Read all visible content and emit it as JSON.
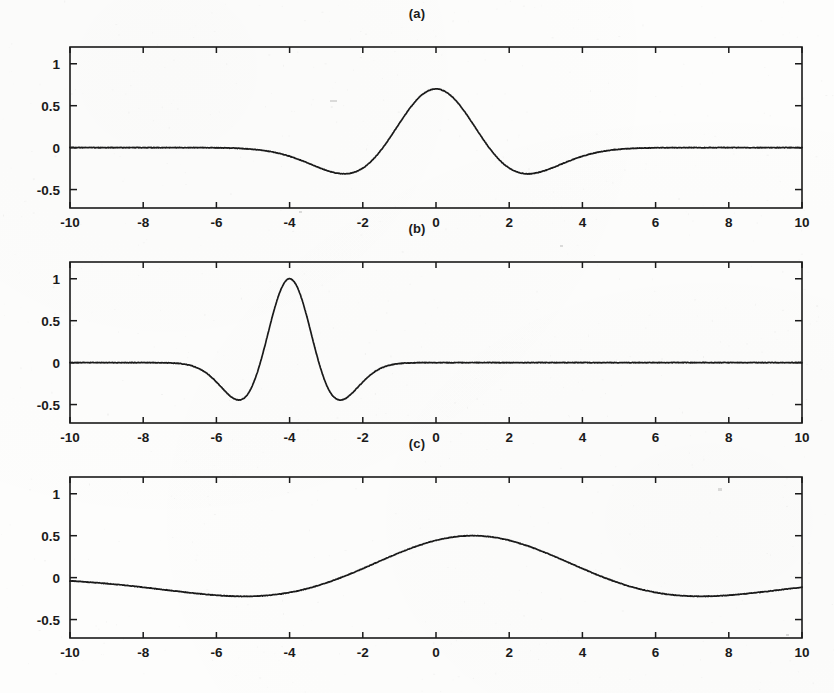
{
  "figure": {
    "background_color": "#fdfdfc",
    "line_color": "#1a1a1a",
    "axis_color": "#1a1a1a",
    "tick_label_color": "#1a1a1a"
  },
  "panels": [
    {
      "title": "(a)",
      "name": "panel-a"
    },
    {
      "title": "(b)",
      "name": "panel-b"
    },
    {
      "title": "(c)",
      "name": "panel-c"
    }
  ],
  "axes": {
    "x_tick_labels": [
      "-10",
      "-8",
      "-6",
      "-4",
      "-2",
      "0",
      "2",
      "4",
      "6",
      "8",
      "10"
    ],
    "x_tick_values": [
      -10,
      -8,
      -6,
      -4,
      -2,
      0,
      2,
      4,
      6,
      8,
      10
    ],
    "y_tick_labels": [
      "1",
      "0.5",
      "0",
      "-0.5"
    ],
    "y_tick_values": [
      1,
      0.5,
      0,
      -0.5
    ],
    "xlim": [
      -10,
      10
    ],
    "ylim": [
      -0.72,
      1.2
    ]
  },
  "chart_data": [
    {
      "type": "line",
      "title": "(a)",
      "xlabel": "",
      "ylabel": "",
      "xlim": [
        -10,
        10
      ],
      "ylim": [
        -0.72,
        1.2
      ],
      "grid": false,
      "legend": null,
      "x_ticks": [
        -10,
        -8,
        -6,
        -4,
        -2,
        0,
        2,
        4,
        6,
        8,
        10
      ],
      "y_ticks": [
        1,
        0.5,
        0,
        -0.5
      ],
      "description": "Mexican hat (Ricker) wavelet, centered at x = 0, scale a = 1.45, peak amplitude 0.70",
      "wavelet": {
        "center": 0,
        "scale": 1.45,
        "amplitude": 0.7
      },
      "peak": {
        "x": 0,
        "y": 0.7
      },
      "troughs": [
        {
          "x": -2.5,
          "y": -0.32
        },
        {
          "x": 2.5,
          "y": -0.32
        }
      ],
      "zero_crossings": [
        -1.45,
        1.45
      ],
      "x": [
        -10,
        -9,
        -8,
        -7,
        -6,
        -5.5,
        -5,
        -4.5,
        -4,
        -3.5,
        -3,
        -2.5,
        -2,
        -1.5,
        -1,
        -0.5,
        0,
        0.5,
        1,
        1.5,
        2,
        2.5,
        3,
        3.5,
        4,
        4.5,
        5,
        5.5,
        6,
        7,
        8,
        9,
        10
      ],
      "y": [
        0,
        0,
        -0.001,
        -0.008,
        -0.045,
        -0.093,
        -0.163,
        -0.244,
        -0.305,
        -0.331,
        -0.312,
        -0.246,
        -0.106,
        0.103,
        0.332,
        0.553,
        0.7,
        0.553,
        0.332,
        0.103,
        -0.106,
        -0.246,
        -0.312,
        -0.331,
        -0.305,
        -0.244,
        -0.163,
        -0.093,
        -0.045,
        -0.008,
        -0.001,
        0,
        0
      ]
    },
    {
      "type": "line",
      "title": "(b)",
      "xlabel": "",
      "ylabel": "",
      "xlim": [
        -10,
        10
      ],
      "ylim": [
        -0.72,
        1.2
      ],
      "grid": false,
      "legend": null,
      "x_ticks": [
        -10,
        -8,
        -6,
        -4,
        -2,
        0,
        2,
        4,
        6,
        8,
        10
      ],
      "y_ticks": [
        1,
        0.5,
        0,
        -0.5
      ],
      "description": "Mexican hat (Ricker) wavelet, translated to x = -4, scale a = 0.8, peak amplitude 1.0",
      "wavelet": {
        "center": -4,
        "scale": 0.8,
        "amplitude": 1.0
      },
      "peak": {
        "x": -4,
        "y": 1.0
      },
      "troughs": [
        {
          "x": -5.2,
          "y": -0.45
        },
        {
          "x": -2.8,
          "y": -0.45
        }
      ],
      "zero_crossings": [
        -4.8,
        -3.2
      ],
      "x": [
        -10,
        -9,
        -8,
        -7.5,
        -7,
        -6.5,
        -6,
        -5.6,
        -5.2,
        -4.8,
        -4.4,
        -4,
        -3.6,
        -3.2,
        -2.8,
        -2.4,
        -2,
        -1.5,
        -1,
        0,
        1,
        2,
        4,
        6,
        8,
        10
      ],
      "y": [
        0,
        0,
        -0.004,
        -0.018,
        -0.06,
        -0.155,
        -0.31,
        -0.418,
        -0.447,
        -0.328,
        0.224,
        1.0,
        0.224,
        -0.328,
        -0.447,
        -0.418,
        -0.31,
        -0.11,
        -0.028,
        -0.001,
        0,
        0,
        0,
        0,
        0,
        0
      ]
    },
    {
      "type": "line",
      "title": "(c)",
      "xlabel": "",
      "ylabel": "",
      "xlim": [
        -10,
        10
      ],
      "ylim": [
        -0.72,
        1.2
      ],
      "grid": false,
      "legend": null,
      "x_ticks": [
        -10,
        -8,
        -6,
        -4,
        -2,
        0,
        2,
        4,
        6,
        8,
        10
      ],
      "y_ticks": [
        1,
        0.5,
        0,
        -0.5
      ],
      "description": "Mexican hat (Ricker) wavelet, dilated to scale a = 3.6, translated to x = 1, peak amplitude 0.50",
      "wavelet": {
        "center": 1,
        "scale": 3.6,
        "amplitude": 0.5
      },
      "peak": {
        "x": 1,
        "y": 0.5
      },
      "troughs": [
        {
          "x": -4.4,
          "y": -0.22
        },
        {
          "x": 6.3,
          "y": -0.22
        }
      ],
      "zero_crossings": [
        -2.6,
        4.6
      ],
      "x": [
        -10,
        -9,
        -8,
        -7,
        -6,
        -5,
        -4.5,
        -4,
        -3,
        -2.5,
        -2,
        -1,
        0,
        1,
        2,
        3,
        4,
        4.5,
        5,
        6,
        6.5,
        7,
        8,
        9,
        10
      ],
      "y": [
        -0.005,
        -0.037,
        -0.082,
        -0.131,
        -0.175,
        -0.207,
        -0.216,
        -0.22,
        -0.207,
        -0.189,
        -0.163,
        -0.07,
        0.065,
        0.5,
        0.065,
        -0.07,
        -0.163,
        -0.189,
        -0.207,
        -0.22,
        -0.217,
        -0.207,
        -0.175,
        -0.131,
        -0.082
      ]
    }
  ]
}
